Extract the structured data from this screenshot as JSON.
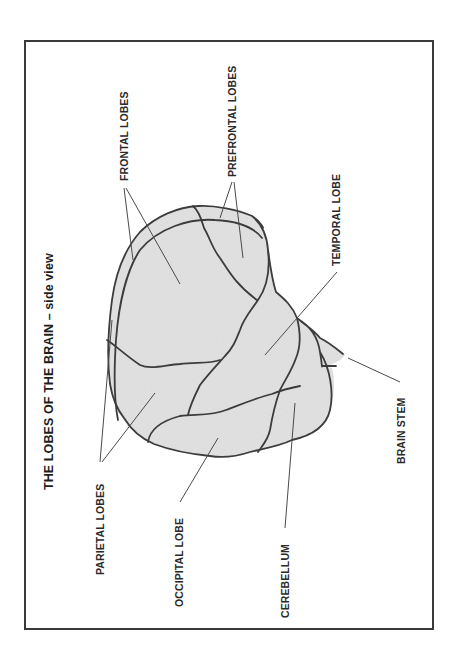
{
  "diagram": {
    "title": "THE LOBES OF THE BRAIN – side view",
    "orientation": "rotated 90° counter-clockwise",
    "colors": {
      "frame": "#3a3a3a",
      "brain_fill": "#dcdcdc",
      "outline": "#3c3c3c",
      "leader_line": "#4a4a4a",
      "text": "#2a2a2a"
    },
    "labels": {
      "frontal": "FRONTAL LOBES",
      "prefrontal": "PREFRONTAL LOBES",
      "temporal": "TEMPORAL LOBE",
      "brain_stem": "BRAIN STEM",
      "parietal": "PARIETAL LOBES",
      "occipital": "OCCIPITAL LOBE",
      "cerebellum": "CEREBELLUM"
    }
  }
}
